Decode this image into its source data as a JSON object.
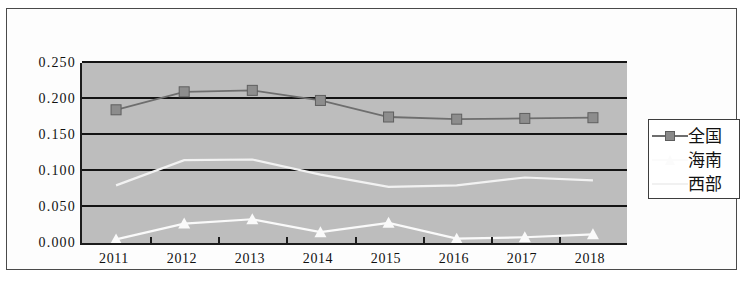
{
  "chart_data": {
    "type": "line",
    "title": "",
    "subtitle": "",
    "xlabel": "",
    "ylabel": "",
    "categories": [
      "2011",
      "2012",
      "2013",
      "2014",
      "2015",
      "2016",
      "2017",
      "2018"
    ],
    "ylim": [
      0.0,
      0.25
    ],
    "ytick_labels": [
      "0.250",
      "0.200",
      "0.150",
      "0.100",
      "0.050",
      "0.000"
    ],
    "ytick_values": [
      0.25,
      0.2,
      0.15,
      0.1,
      0.05,
      0.0
    ],
    "grid": true,
    "legend_position": "right",
    "plot_background": "#bdbdbd",
    "series": [
      {
        "name": "全国",
        "marker": "square",
        "color": "#6e6e6e",
        "values": [
          0.185,
          0.21,
          0.212,
          0.198,
          0.175,
          0.172,
          0.173,
          0.174
        ]
      },
      {
        "name": "海南",
        "marker": "triangle",
        "color": "#fafafa",
        "values": [
          0.005,
          0.027,
          0.033,
          0.015,
          0.028,
          0.006,
          0.008,
          0.012
        ]
      },
      {
        "name": "西部",
        "marker": "none",
        "color": "#f2f2f2",
        "values": [
          0.08,
          0.115,
          0.116,
          0.095,
          0.078,
          0.08,
          0.091,
          0.087
        ]
      }
    ]
  },
  "legend": {
    "entries": [
      {
        "label": "全国"
      },
      {
        "label": "海南"
      },
      {
        "label": "西部"
      }
    ]
  }
}
